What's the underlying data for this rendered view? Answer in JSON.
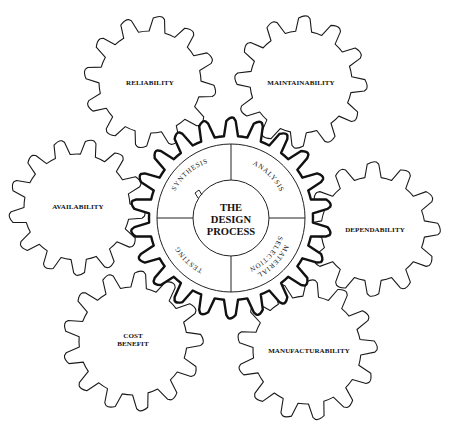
{
  "diagram": {
    "title_lines": [
      "THE",
      "DESIGN",
      "PROCESS"
    ],
    "center_segments": [
      {
        "label": "SYNTHESIS"
      },
      {
        "label": "ANALYSIS"
      },
      {
        "label": "MATERIAL SELECTION"
      },
      {
        "label": "TESTING"
      }
    ],
    "surrounding_gears": [
      {
        "id": "reliability",
        "label_lines": [
          "RELIABILITY"
        ]
      },
      {
        "id": "maintainability",
        "label_lines": [
          "MAINTAINABILITY"
        ]
      },
      {
        "id": "availability",
        "label_lines": [
          "AVAILABILITY"
        ]
      },
      {
        "id": "dependability",
        "label_lines": [
          "DEPENDABILITY"
        ]
      },
      {
        "id": "cost-benefit",
        "label_lines": [
          "COST",
          "BENEFIT"
        ]
      },
      {
        "id": "manufacturability",
        "label_lines": [
          "MANUFACTURABILITY"
        ]
      }
    ],
    "colors": {
      "line": "#1a1a1a",
      "background": "#ffffff"
    }
  }
}
